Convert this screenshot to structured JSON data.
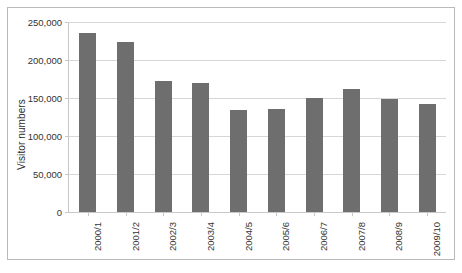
{
  "chart_data": {
    "type": "bar",
    "title": "",
    "xlabel": "",
    "ylabel": "Visitor numbers",
    "categories": [
      "2000/1",
      "2001/2",
      "2002/3",
      "2003/4",
      "2004/5",
      "2005/6",
      "2006/7",
      "2007/8",
      "2008/9",
      "2009/10"
    ],
    "values": [
      235000,
      224000,
      173000,
      170000,
      134000,
      135000,
      150000,
      162000,
      149000,
      142000
    ],
    "series": [
      {
        "name": "Visitor numbers",
        "values": [
          235000,
          224000,
          173000,
          170000,
          134000,
          135000,
          150000,
          162000,
          149000,
          142000
        ]
      }
    ],
    "ylim": [
      0,
      250000
    ],
    "yticks": [
      0,
      50000,
      100000,
      150000,
      200000,
      250000
    ],
    "ytick_labels": [
      "0",
      "50,000",
      "100,000",
      "150,000",
      "200,000",
      "250,000"
    ],
    "grid": true,
    "legend": false,
    "legend_position": "none",
    "bar_color": "#6e6e6e",
    "gridline_color": "#d6d6d6",
    "axis_color": "#c8c8c8",
    "border_color": "#b9b9b9",
    "background_color": "#ffffff"
  }
}
